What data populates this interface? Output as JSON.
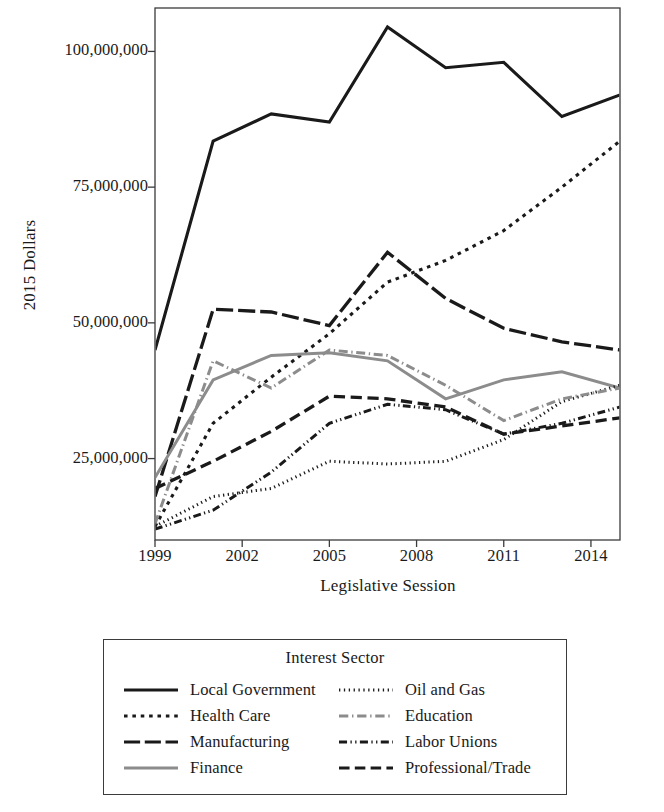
{
  "chart_data": {
    "type": "line",
    "title": "",
    "xlabel": "Legislative Session",
    "ylabel": "2015 Dollars",
    "legend_title": "Interest Sector",
    "legend_position": "bottom",
    "grid": false,
    "xlim": [
      1999,
      2015
    ],
    "ylim": [
      10000000,
      108000000
    ],
    "xticks": [
      1999,
      2002,
      2005,
      2008,
      2011,
      2014
    ],
    "xtick_labels": [
      "1999",
      "2002",
      "2005",
      "2008",
      "2011",
      "2014"
    ],
    "yticks": [
      25000000,
      50000000,
      75000000,
      100000000
    ],
    "ytick_labels": [
      "25,000,000",
      "50,000,000",
      "75,000,000",
      "100,000,000"
    ],
    "x": [
      1999,
      2001,
      2003,
      2005,
      2007,
      2009,
      2011,
      2013,
      2015
    ],
    "series": [
      {
        "name": "Local Government",
        "style": "solid",
        "color": "#1a1a1a",
        "width": 3.1,
        "values": [
          45000000,
          83500000,
          88500000,
          87000000,
          104500000,
          97000000,
          98000000,
          88000000,
          92000000
        ]
      },
      {
        "name": "Health Care",
        "style": "dotted-square",
        "color": "#1a1a1a",
        "width": 3.1,
        "values": [
          12500000,
          31500000,
          40000000,
          48000000,
          57500000,
          61500000,
          67000000,
          75000000,
          83500000
        ]
      },
      {
        "name": "Manufacturing",
        "style": "dash-solid",
        "color": "#1a1a1a",
        "width": 3.3,
        "values": [
          18000000,
          52500000,
          52000000,
          49500000,
          63000000,
          54500000,
          49000000,
          46500000,
          45000000
        ]
      },
      {
        "name": "Finance",
        "style": "solid",
        "color": "#8c8c8c",
        "width": 3.0,
        "values": [
          21500000,
          39500000,
          44000000,
          44500000,
          43000000,
          36000000,
          39500000,
          41000000,
          38000000
        ]
      },
      {
        "name": "Oil and Gas",
        "style": "dotted-fine",
        "color": "#1a1a1a",
        "width": 3.0,
        "values": [
          12500000,
          18000000,
          19500000,
          24500000,
          24000000,
          24500000,
          28500000,
          35500000,
          38500000
        ]
      },
      {
        "name": "Education",
        "style": "dash-dot",
        "color": "#8c8c8c",
        "width": 3.0,
        "values": [
          13000000,
          43000000,
          38000000,
          45000000,
          44000000,
          38500000,
          32000000,
          36000000,
          38000000
        ]
      },
      {
        "name": "Labor Unions",
        "style": "dash-dot-dot",
        "color": "#1a1a1a",
        "width": 3.0,
        "values": [
          12000000,
          15500000,
          22500000,
          31500000,
          35000000,
          34000000,
          29500000,
          31500000,
          34500000
        ]
      },
      {
        "name": "Professional/Trade",
        "style": "long-dash",
        "color": "#1a1a1a",
        "width": 3.3,
        "values": [
          19500000,
          24500000,
          30000000,
          36500000,
          36000000,
          34500000,
          29500000,
          31000000,
          32500000
        ]
      }
    ]
  },
  "legend": {
    "title": "Interest Sector",
    "items": [
      {
        "label": "Local Government",
        "style": "solid",
        "color": "#1a1a1a"
      },
      {
        "label": "Oil and Gas",
        "style": "dotted-fine",
        "color": "#1a1a1a"
      },
      {
        "label": "Health Care",
        "style": "dotted-square",
        "color": "#1a1a1a"
      },
      {
        "label": "Education",
        "style": "dash-dot",
        "color": "#8c8c8c"
      },
      {
        "label": "Manufacturing",
        "style": "dash-solid",
        "color": "#1a1a1a"
      },
      {
        "label": "Labor Unions",
        "style": "dash-dot-dot",
        "color": "#1a1a1a"
      },
      {
        "label": "Finance",
        "style": "solid",
        "color": "#8c8c8c"
      },
      {
        "label": "Professional/Trade",
        "style": "long-dash",
        "color": "#1a1a1a"
      }
    ]
  },
  "axes": {
    "frame_color": "#3b3b3b"
  }
}
